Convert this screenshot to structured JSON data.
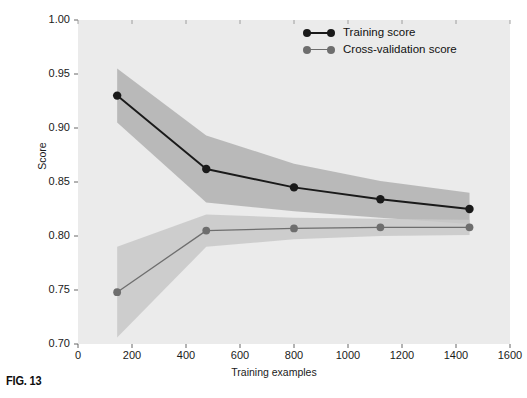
{
  "figure": {
    "caption": "FIG. 13"
  },
  "chart_data": {
    "type": "line",
    "title": "",
    "xlabel": "Training examples",
    "ylabel": "Score",
    "xlim": [
      0,
      1600
    ],
    "ylim": [
      0.7,
      1.0
    ],
    "grid": false,
    "background": "#ebebeb",
    "legend_position": "top-right",
    "xticks": [
      0,
      200,
      400,
      600,
      800,
      1000,
      1200,
      1400,
      1600
    ],
    "xtick_labels": [
      "0",
      "200",
      "400",
      "600",
      "800",
      "1000",
      "1200",
      "1400",
      "1600"
    ],
    "yticks": [
      0.7,
      0.75,
      0.8,
      0.85,
      0.9,
      0.95,
      1.0
    ],
    "ytick_labels": [
      "0.70",
      "0.75",
      "0.80",
      "0.85",
      "0.90",
      "0.95",
      "1.00"
    ],
    "x": [
      145,
      475,
      800,
      1120,
      1450
    ],
    "series": [
      {
        "name": "Training score",
        "color": "#1a1a1a",
        "marker": "circle",
        "values": [
          0.93,
          0.862,
          0.845,
          0.834,
          0.825
        ],
        "band_upper": [
          0.955,
          0.893,
          0.867,
          0.851,
          0.84
        ],
        "band_lower": [
          0.905,
          0.831,
          0.823,
          0.817,
          0.811
        ],
        "band_color": "#b0b0b0"
      },
      {
        "name": "Cross-validation score",
        "color": "#6e6e6e",
        "marker": "circle",
        "values": [
          0.748,
          0.805,
          0.807,
          0.808,
          0.808
        ],
        "band_upper": [
          0.79,
          0.82,
          0.817,
          0.816,
          0.815
        ],
        "band_lower": [
          0.706,
          0.79,
          0.797,
          0.8,
          0.801
        ],
        "band_color": "#c8c8c8"
      }
    ]
  },
  "legend": {
    "items": [
      {
        "label": "Training score",
        "color": "#1a1a1a"
      },
      {
        "label": "Cross-validation score",
        "color": "#6e6e6e"
      }
    ]
  }
}
